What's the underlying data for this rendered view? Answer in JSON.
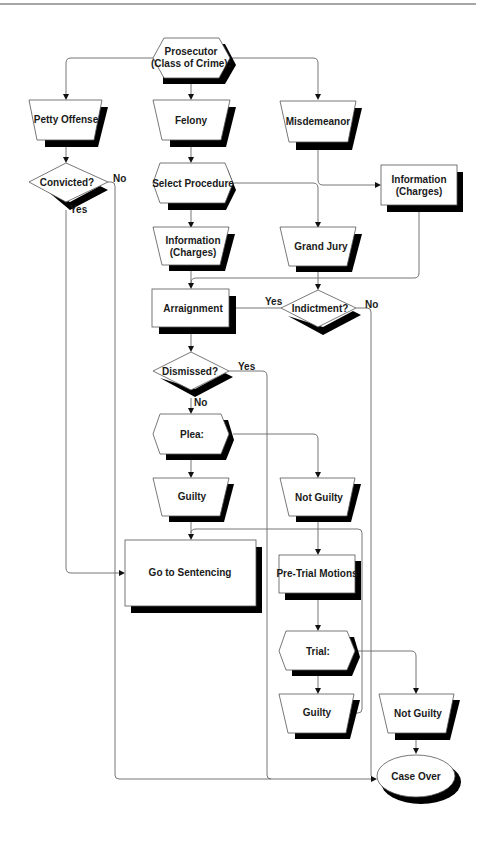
{
  "diagram": {
    "type": "flowchart",
    "nodes": {
      "prosecutor": {
        "line1": "Prosecutor",
        "line2": "(Class of Crime):",
        "shape": "hexagon"
      },
      "petty_offense": {
        "label": "Petty Offense",
        "shape": "trapezoid"
      },
      "felony": {
        "label": "Felony",
        "shape": "trapezoid"
      },
      "misdemeanor": {
        "label": "Misdemeanor",
        "shape": "trapezoid"
      },
      "convicted": {
        "label": "Convicted?",
        "shape": "diamond"
      },
      "select_procedure": {
        "label": "Select Procedure",
        "shape": "hexagon"
      },
      "information_right": {
        "line1": "Information",
        "line2": "(Charges)",
        "shape": "rectangle"
      },
      "information_mid": {
        "line1": "Information",
        "line2": "(Charges)",
        "shape": "trapezoid"
      },
      "grand_jury": {
        "label": "Grand Jury",
        "shape": "trapezoid"
      },
      "arraignment": {
        "label": "Arraignment",
        "shape": "rectangle"
      },
      "indictment": {
        "label": "Indictment?",
        "shape": "diamond"
      },
      "dismissed": {
        "label": "Dismissed?",
        "shape": "diamond"
      },
      "plea": {
        "label": "Plea:",
        "shape": "hexagon"
      },
      "guilty_plea": {
        "label": "Guilty",
        "shape": "trapezoid"
      },
      "not_guilty_plea": {
        "label": "Not Guilty",
        "shape": "trapezoid"
      },
      "sentencing": {
        "label": "Go to Sentencing",
        "shape": "rectangle"
      },
      "pretrial": {
        "label": "Pre-Trial Motions",
        "shape": "rectangle"
      },
      "trial": {
        "label": "Trial:",
        "shape": "hexagon"
      },
      "guilty_trial": {
        "label": "Guilty",
        "shape": "trapezoid"
      },
      "not_guilty_trial": {
        "label": "Not Guilty",
        "shape": "trapezoid"
      },
      "case_over": {
        "label": "Case Over",
        "shape": "ellipse"
      }
    },
    "edge_labels": {
      "convicted_no": "No",
      "convicted_yes": "Yes",
      "indictment_yes": "Yes",
      "indictment_no": "No",
      "dismissed_yes": "Yes",
      "dismissed_no": "No"
    },
    "edges": [
      {
        "from": "prosecutor",
        "to": "petty_offense"
      },
      {
        "from": "prosecutor",
        "to": "felony"
      },
      {
        "from": "prosecutor",
        "to": "misdemeanor"
      },
      {
        "from": "petty_offense",
        "to": "convicted"
      },
      {
        "from": "convicted",
        "to": "sentencing",
        "label": "Yes"
      },
      {
        "from": "convicted",
        "to": "case_over",
        "label": "No"
      },
      {
        "from": "felony",
        "to": "select_procedure"
      },
      {
        "from": "select_procedure",
        "to": "information_mid"
      },
      {
        "from": "select_procedure",
        "to": "grand_jury"
      },
      {
        "from": "misdemeanor",
        "to": "information_right"
      },
      {
        "from": "information_right",
        "to": "arraignment"
      },
      {
        "from": "information_mid",
        "to": "arraignment"
      },
      {
        "from": "grand_jury",
        "to": "indictment"
      },
      {
        "from": "indictment",
        "to": "arraignment",
        "label": "Yes"
      },
      {
        "from": "indictment",
        "to": "case_over",
        "label": "No"
      },
      {
        "from": "arraignment",
        "to": "dismissed"
      },
      {
        "from": "dismissed",
        "to": "case_over",
        "label": "Yes"
      },
      {
        "from": "dismissed",
        "to": "plea",
        "label": "No"
      },
      {
        "from": "plea",
        "to": "guilty_plea"
      },
      {
        "from": "plea",
        "to": "not_guilty_plea"
      },
      {
        "from": "guilty_plea",
        "to": "sentencing"
      },
      {
        "from": "not_guilty_plea",
        "to": "pretrial"
      },
      {
        "from": "pretrial",
        "to": "trial"
      },
      {
        "from": "trial",
        "to": "guilty_trial"
      },
      {
        "from": "trial",
        "to": "not_guilty_trial"
      },
      {
        "from": "guilty_trial",
        "to": "sentencing"
      },
      {
        "from": "not_guilty_trial",
        "to": "case_over"
      }
    ]
  }
}
